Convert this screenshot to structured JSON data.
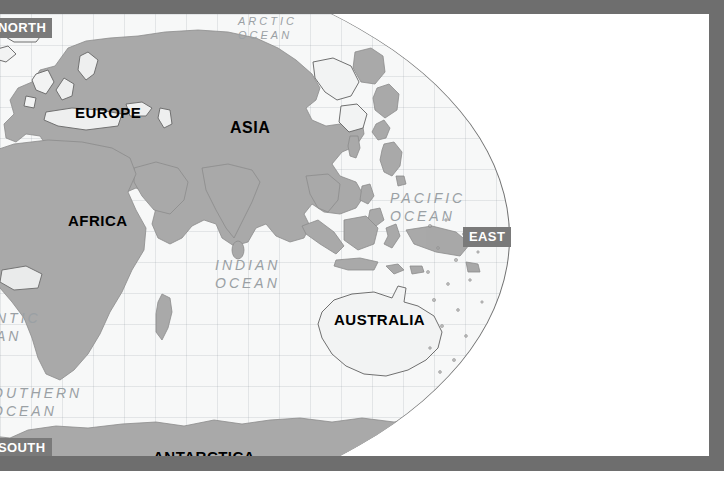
{
  "map": {
    "title": "World Map — Eastern Hemisphere",
    "projection": "globe",
    "colors": {
      "frame": "#6e6e6e",
      "ocean": "#f7f8f8",
      "land_dark": "#a9a9a9",
      "land_light": "#f2f3f3",
      "page_background": "#ffffff",
      "continent_label": "#000000",
      "ocean_label": "#9aa0a4",
      "direction_chip_bg": "#7a7a7a",
      "direction_chip_text": "#ffffff"
    },
    "continents": [
      {
        "id": "europe",
        "label": "EUROPE",
        "x": 75,
        "y": 90,
        "size": 15
      },
      {
        "id": "asia",
        "label": "ASIA",
        "x": 230,
        "y": 110,
        "size": 16
      },
      {
        "id": "africa",
        "label": "AFRICA",
        "x": 68,
        "y": 205,
        "size": 15
      },
      {
        "id": "australia",
        "label": "AUSTRALIA",
        "x": 334,
        "y": 306,
        "size": 15
      },
      {
        "id": "antarctica",
        "label": "ANTARCTICA",
        "x": 153,
        "y": 444,
        "size": 15
      }
    ],
    "oceans": [
      {
        "id": "arctic-ocean",
        "lines": [
          "ARCTIC",
          "OCEAN"
        ],
        "x": 238,
        "y": 14,
        "size": 11
      },
      {
        "id": "pacific-ocean",
        "lines": [
          "PACIFIC",
          "OCEAN"
        ],
        "x": 390,
        "y": 190,
        "size": 14
      },
      {
        "id": "indian-ocean",
        "lines": [
          "INDIAN",
          "OCEAN"
        ],
        "x": 215,
        "y": 257,
        "size": 14
      },
      {
        "id": "atlantic-ocean",
        "lines": [
          "NTIC",
          "AN"
        ],
        "x": 0,
        "y": 310,
        "size": 14
      },
      {
        "id": "southern-ocean",
        "lines": [
          "OUTHERN",
          "OCEAN"
        ],
        "x": 0,
        "y": 385,
        "size": 14
      }
    ],
    "directions": [
      {
        "id": "north",
        "label": "NORTH",
        "x": -8,
        "y": 18,
        "size": 13
      },
      {
        "id": "east",
        "label": "EAST",
        "x": 463,
        "y": 227,
        "size": 13
      },
      {
        "id": "south",
        "label": "SOUTH",
        "x": -8,
        "y": 438,
        "size": 13
      }
    ]
  }
}
